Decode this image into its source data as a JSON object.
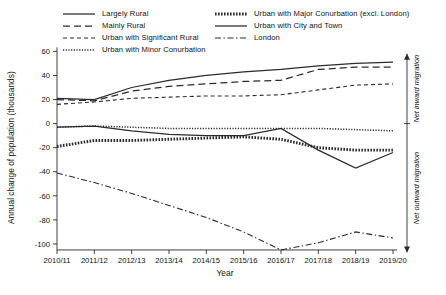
{
  "chart_data": {
    "type": "line",
    "title": "",
    "xlabel": "Year",
    "ylabel": "Annual change of population (thousands)",
    "categories": [
      "2010/11",
      "2011/12",
      "2012/13",
      "2013/14",
      "2014/15",
      "2015/16",
      "2016/17",
      "2017/18",
      "2018/19",
      "2019/20"
    ],
    "ylim": [
      -110,
      62
    ],
    "yticks": [
      60,
      40,
      20,
      0,
      -20,
      -40,
      -60,
      -80,
      -100
    ],
    "ytick_labels": [
      "60",
      "40",
      "20",
      "0",
      "-20",
      "-40",
      "-60",
      "-80",
      "-100"
    ],
    "grid": false,
    "legend_position": "top",
    "series": [
      {
        "name": "Largely Rural",
        "style": "solid",
        "values": [
          21,
          20,
          30,
          36,
          40,
          43,
          45,
          48,
          50,
          51
        ]
      },
      {
        "name": "Mainly Rural",
        "style": "dashed-long",
        "values": [
          20,
          19,
          27,
          31,
          33,
          35,
          36,
          45,
          47,
          47
        ]
      },
      {
        "name": "Urban with Significant Rural",
        "style": "dashed-short",
        "values": [
          16,
          18,
          21,
          22,
          23,
          23,
          24,
          28,
          32,
          33
        ]
      },
      {
        "name": "Urban with Minor Conurbation",
        "style": "dotted-fine",
        "values": [
          -3,
          -2,
          -3,
          -4,
          -4,
          -4,
          -4,
          -4,
          -5,
          -6
        ]
      },
      {
        "name": "Urban with Major Conurbation (excl. London)",
        "style": "dotted-thick",
        "values": [
          -19,
          -14,
          -14,
          -13,
          -12,
          -11,
          -13,
          -20,
          -22,
          -22
        ]
      },
      {
        "name": "Urban with City and Town",
        "style": "solid",
        "values": [
          -3,
          -2,
          -6,
          -9,
          -10,
          -10,
          -4,
          -22,
          -37,
          -24
        ]
      },
      {
        "name": "London",
        "style": "dash-dot",
        "values": [
          -41,
          -49,
          -58,
          -68,
          -78,
          -90,
          -105,
          -99,
          -90,
          -95
        ]
      }
    ],
    "annotations": [
      {
        "id": "net-inward",
        "text": "Net inward migration",
        "region": "above-zero"
      },
      {
        "id": "net-outward",
        "text": "Net outward migration",
        "region": "below-zero"
      }
    ]
  },
  "legend": {
    "items": [
      {
        "label": "Largely Rural",
        "style": "solid",
        "column": 0
      },
      {
        "label": "Mainly Rural",
        "style": "dashed-long",
        "column": 0
      },
      {
        "label": "Urban with Significant Rural",
        "style": "dashed-short",
        "column": 0
      },
      {
        "label": "Urban with Minor Conurbation",
        "style": "dotted-fine",
        "column": 0
      },
      {
        "label": "Urban with Major Conurbation (excl. London)",
        "style": "dotted-thick",
        "column": 1
      },
      {
        "label": "Urban with City and Town",
        "style": "solid",
        "column": 1
      },
      {
        "label": "London",
        "style": "dash-dot",
        "column": 1
      }
    ]
  }
}
